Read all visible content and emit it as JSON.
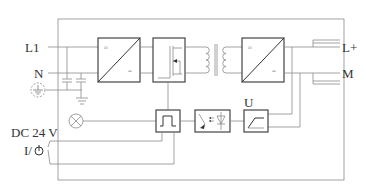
{
  "diagram": {
    "type": "block-diagram",
    "labels": {
      "l1": "L1",
      "n": "N",
      "lplus": "L+",
      "m": "M",
      "dc24v": "DC 24 V",
      "switch": "I/⏻",
      "u": "U"
    },
    "blocks": [
      {
        "id": "rectifier",
        "name": "AC/DC converter",
        "symbol_top": "≈",
        "symbol_bottom": "="
      },
      {
        "id": "switch-transistor",
        "name": "MOSFET switch"
      },
      {
        "id": "transformer",
        "name": "Transformer"
      },
      {
        "id": "output-rectifier",
        "name": "AC/DC converter",
        "symbol_top": "≈",
        "symbol_bottom": "="
      },
      {
        "id": "pwm",
        "name": "Pulse generator"
      },
      {
        "id": "optocoupler",
        "name": "Optocoupler"
      },
      {
        "id": "voltage-regulator",
        "name": "Voltage control"
      },
      {
        "id": "indicator-lamp",
        "name": "Indicator lamp"
      },
      {
        "id": "ground",
        "name": "Ground"
      }
    ],
    "symbols": {
      "ac": "≈",
      "dc": "="
    }
  }
}
